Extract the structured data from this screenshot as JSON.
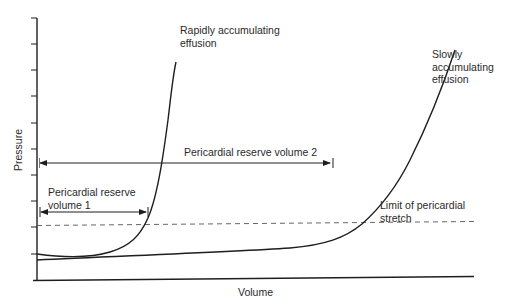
{
  "diagram": {
    "axes": {
      "x_label": "Volume",
      "y_label": "Pressure",
      "y_tick_count": 10
    },
    "curves": [
      {
        "name": "rapid",
        "label_line1": "Rapidly accumulating",
        "label_line2": "effusion"
      },
      {
        "name": "slow",
        "label_line1": "Slowly",
        "label_line2": "accumulating",
        "label_line3": "effusion"
      }
    ],
    "annotations": {
      "reserve_volume_2": "Pericardial reserve volume 2",
      "reserve_volume_1_line1": "Pericardial reserve",
      "reserve_volume_1_line2": "volume 1",
      "limit_line1": "Limit of pericardial",
      "limit_line2": "stretch"
    },
    "colors": {
      "line": "#1e1e1e",
      "dashed": "#555555",
      "text": "#2a2a2a"
    }
  }
}
